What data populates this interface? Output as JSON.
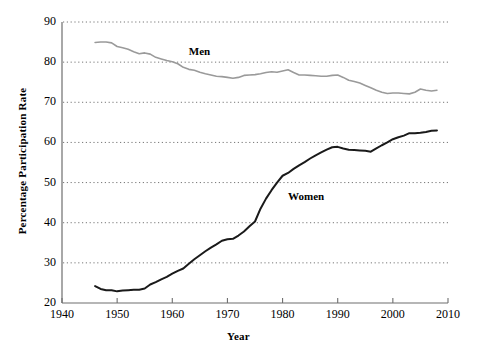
{
  "chart_data": {
    "type": "line",
    "title": "",
    "xlabel": "Year",
    "ylabel": "Percentage Participation Rate",
    "xlim": [
      1940,
      2010
    ],
    "ylim": [
      20,
      90
    ],
    "xticks": [
      1940,
      1950,
      1960,
      1970,
      1980,
      1990,
      2000,
      2010
    ],
    "yticks": [
      20,
      30,
      40,
      50,
      60,
      70,
      80,
      90
    ],
    "grid": "horizontal-dotted",
    "legend": "inline-annotations",
    "annotations": [
      {
        "text": "Men",
        "x": 1963,
        "y": 82.5
      },
      {
        "text": "Women",
        "x": 1981,
        "y": 46.5
      }
    ],
    "series": [
      {
        "name": "Men",
        "color": "#9a9a9a",
        "x": [
          1946,
          1947,
          1948,
          1949,
          1950,
          1951,
          1952,
          1953,
          1954,
          1955,
          1956,
          1957,
          1958,
          1959,
          1960,
          1961,
          1962,
          1963,
          1964,
          1965,
          1966,
          1967,
          1968,
          1969,
          1970,
          1971,
          1972,
          1973,
          1974,
          1975,
          1976,
          1977,
          1978,
          1979,
          1980,
          1981,
          1982,
          1983,
          1984,
          1985,
          1986,
          1987,
          1988,
          1989,
          1990,
          1991,
          1992,
          1993,
          1994,
          1995,
          1996,
          1997,
          1998,
          1999,
          2000,
          2001,
          2002,
          2003,
          2004,
          2005,
          2006,
          2007,
          2008
        ],
        "values": [
          84.9,
          85.0,
          85.0,
          84.8,
          83.9,
          83.6,
          83.2,
          82.6,
          82.1,
          82.3,
          82.0,
          81.2,
          80.8,
          80.4,
          80.1,
          79.6,
          78.7,
          78.2,
          78.0,
          77.5,
          77.1,
          76.8,
          76.5,
          76.4,
          76.2,
          76.0,
          76.2,
          76.7,
          76.8,
          76.9,
          77.1,
          77.4,
          77.6,
          77.5,
          77.8,
          78.1,
          77.4,
          76.8,
          76.8,
          76.7,
          76.6,
          76.5,
          76.5,
          76.7,
          76.8,
          76.2,
          75.5,
          75.2,
          74.8,
          74.2,
          73.6,
          73.0,
          72.5,
          72.2,
          72.3,
          72.3,
          72.2,
          72.1,
          72.5,
          73.3,
          73.0,
          72.8,
          73.0
        ]
      },
      {
        "name": "Women",
        "color": "#1a1a1a",
        "x": [
          1946,
          1947,
          1948,
          1949,
          1950,
          1951,
          1952,
          1953,
          1954,
          1955,
          1956,
          1957,
          1958,
          1959,
          1960,
          1961,
          1962,
          1963,
          1964,
          1965,
          1966,
          1967,
          1968,
          1969,
          1970,
          1971,
          1972,
          1973,
          1974,
          1975,
          1976,
          1977,
          1978,
          1979,
          1980,
          1981,
          1982,
          1983,
          1984,
          1985,
          1986,
          1987,
          1988,
          1989,
          1990,
          1991,
          1992,
          1993,
          1994,
          1995,
          1996,
          1997,
          1998,
          1999,
          2000,
          2001,
          2002,
          2003,
          2004,
          2005,
          2006,
          2007,
          2008
        ],
        "values": [
          24.2,
          23.5,
          23.2,
          23.2,
          22.9,
          23.1,
          23.2,
          23.3,
          23.3,
          23.6,
          24.6,
          25.2,
          25.9,
          26.5,
          27.3,
          28.0,
          28.6,
          29.8,
          30.9,
          31.9,
          32.9,
          33.8,
          34.6,
          35.5,
          35.9,
          36.0,
          36.8,
          37.8,
          39.1,
          40.3,
          43.5,
          46.0,
          48.1,
          50.0,
          51.7,
          52.4,
          53.4,
          54.3,
          55.1,
          56.0,
          56.8,
          57.5,
          58.2,
          58.8,
          58.9,
          58.5,
          58.2,
          58.1,
          58.0,
          57.9,
          57.7,
          58.5,
          59.3,
          60.0,
          60.8,
          61.3,
          61.7,
          62.3,
          62.3,
          62.4,
          62.6,
          62.9,
          63.0
        ]
      }
    ]
  },
  "axes": {
    "y_tick_labels": [
      "90",
      "80",
      "70",
      "60",
      "50",
      "40",
      "30",
      "20"
    ],
    "x_tick_labels": [
      "1940",
      "1950",
      "1960",
      "1970",
      "1980",
      "1990",
      "2000",
      "2010"
    ],
    "x_title": "Year",
    "y_title": "Percentage Participation Rate"
  },
  "labels": {
    "men": "Men",
    "women": "Women"
  },
  "colors": {
    "men_line": "#9a9a9a",
    "women_line": "#1a1a1a",
    "axis": "#6e6e6e",
    "grid": "#777777",
    "background": "#ffffff"
  }
}
